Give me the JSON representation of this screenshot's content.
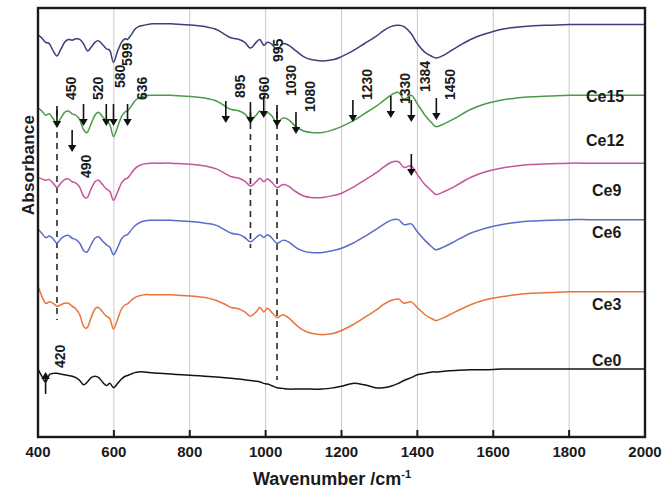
{
  "chart_data": {
    "type": "line",
    "title": "",
    "xlabel": "Wavenumber /cm",
    "xlabel_sup": "-1",
    "ylabel": "Absorbance",
    "xlim": [
      400,
      2000
    ],
    "xticks": [
      400,
      600,
      800,
      1000,
      1200,
      1400,
      1600,
      1800,
      2000
    ],
    "xtick_labels": [
      "400",
      "600",
      "800",
      "1000",
      "1200",
      "1400",
      "1600",
      "1800",
      "2000"
    ],
    "ylim": [
      0,
      6
    ],
    "yticks": [],
    "ytick_labels": [],
    "grid": "vertical-only",
    "legend_position": "right-inline",
    "series": [
      {
        "name": "Ce15",
        "color": "#3b3f7a",
        "offset": 5.0,
        "x": [
          400,
          410,
          420,
          430,
          440,
          450,
          460,
          470,
          480,
          490,
          500,
          510,
          520,
          530,
          540,
          550,
          560,
          570,
          580,
          590,
          599,
          610,
          620,
          630,
          636,
          645,
          655,
          665,
          680,
          700,
          720,
          750,
          780,
          810,
          840,
          870,
          895,
          910,
          930,
          945,
          960,
          975,
          985,
          995,
          1005,
          1015,
          1030,
          1045,
          1060,
          1080,
          1100,
          1120,
          1150,
          1180,
          1200,
          1230,
          1260,
          1290,
          1310,
          1330,
          1350,
          1365,
          1384,
          1400,
          1420,
          1440,
          1450,
          1470,
          1500,
          1540,
          1580,
          1620,
          1660,
          1700,
          1750,
          1800,
          1850,
          1900,
          1950,
          2000
        ],
        "y": [
          0.62,
          0.58,
          0.52,
          0.5,
          0.4,
          0.33,
          0.42,
          0.52,
          0.56,
          0.55,
          0.57,
          0.56,
          0.5,
          0.4,
          0.45,
          0.52,
          0.54,
          0.49,
          0.43,
          0.4,
          0.24,
          0.4,
          0.52,
          0.57,
          0.56,
          0.62,
          0.7,
          0.74,
          0.76,
          0.78,
          0.78,
          0.78,
          0.77,
          0.76,
          0.74,
          0.7,
          0.62,
          0.58,
          0.56,
          0.52,
          0.44,
          0.52,
          0.56,
          0.48,
          0.52,
          0.5,
          0.42,
          0.5,
          0.48,
          0.4,
          0.32,
          0.28,
          0.26,
          0.28,
          0.32,
          0.4,
          0.5,
          0.6,
          0.68,
          0.74,
          0.76,
          0.74,
          0.64,
          0.5,
          0.38,
          0.32,
          0.3,
          0.34,
          0.44,
          0.56,
          0.64,
          0.7,
          0.73,
          0.75,
          0.76,
          0.77,
          0.77,
          0.77,
          0.77,
          0.77
        ]
      },
      {
        "name": "Ce12",
        "color": "#4a9a4a",
        "offset": 4.0,
        "x": [
          400,
          410,
          420,
          430,
          440,
          450,
          460,
          470,
          480,
          490,
          500,
          510,
          520,
          530,
          540,
          550,
          560,
          570,
          580,
          590,
          599,
          610,
          620,
          630,
          636,
          645,
          655,
          665,
          680,
          700,
          720,
          750,
          780,
          810,
          840,
          870,
          895,
          910,
          930,
          945,
          960,
          975,
          985,
          995,
          1005,
          1015,
          1030,
          1045,
          1060,
          1080,
          1100,
          1120,
          1150,
          1180,
          1200,
          1230,
          1260,
          1290,
          1310,
          1330,
          1350,
          1365,
          1384,
          1400,
          1420,
          1440,
          1450,
          1470,
          1500,
          1540,
          1580,
          1620,
          1660,
          1700,
          1750,
          1800,
          1850,
          1900,
          1950,
          2000
        ],
        "y": [
          0.6,
          0.56,
          0.5,
          0.52,
          0.45,
          0.38,
          0.46,
          0.54,
          0.56,
          0.52,
          0.5,
          0.44,
          0.3,
          0.26,
          0.38,
          0.5,
          0.54,
          0.48,
          0.42,
          0.36,
          0.2,
          0.34,
          0.48,
          0.55,
          0.56,
          0.62,
          0.7,
          0.74,
          0.77,
          0.78,
          0.78,
          0.78,
          0.77,
          0.76,
          0.74,
          0.7,
          0.62,
          0.58,
          0.56,
          0.52,
          0.44,
          0.5,
          0.56,
          0.5,
          0.54,
          0.5,
          0.4,
          0.46,
          0.44,
          0.34,
          0.28,
          0.26,
          0.26,
          0.3,
          0.34,
          0.42,
          0.52,
          0.62,
          0.7,
          0.78,
          0.82,
          0.72,
          0.78,
          0.66,
          0.5,
          0.38,
          0.34,
          0.38,
          0.46,
          0.58,
          0.66,
          0.71,
          0.74,
          0.76,
          0.77,
          0.78,
          0.78,
          0.78,
          0.78,
          0.78
        ]
      },
      {
        "name": "Ce9",
        "color": "#c4559c",
        "offset": 3.05,
        "x": [
          400,
          410,
          420,
          430,
          440,
          450,
          460,
          470,
          480,
          490,
          500,
          510,
          520,
          530,
          540,
          550,
          560,
          570,
          580,
          590,
          599,
          610,
          620,
          630,
          636,
          645,
          655,
          665,
          680,
          700,
          720,
          750,
          780,
          810,
          840,
          870,
          895,
          910,
          930,
          945,
          960,
          975,
          985,
          995,
          1005,
          1015,
          1030,
          1045,
          1060,
          1080,
          1100,
          1120,
          1150,
          1180,
          1200,
          1230,
          1260,
          1290,
          1310,
          1330,
          1350,
          1365,
          1384,
          1400,
          1420,
          1440,
          1450,
          1470,
          1500,
          1540,
          1580,
          1620,
          1660,
          1700,
          1750,
          1800,
          1850,
          1900,
          1950,
          2000
        ],
        "y": [
          0.58,
          0.56,
          0.54,
          0.55,
          0.5,
          0.44,
          0.5,
          0.55,
          0.56,
          0.52,
          0.5,
          0.44,
          0.32,
          0.3,
          0.42,
          0.52,
          0.54,
          0.48,
          0.42,
          0.38,
          0.26,
          0.38,
          0.5,
          0.56,
          0.57,
          0.63,
          0.7,
          0.74,
          0.77,
          0.78,
          0.78,
          0.78,
          0.77,
          0.76,
          0.74,
          0.7,
          0.63,
          0.59,
          0.57,
          0.53,
          0.46,
          0.52,
          0.57,
          0.52,
          0.56,
          0.52,
          0.44,
          0.48,
          0.46,
          0.38,
          0.32,
          0.3,
          0.3,
          0.33,
          0.36,
          0.44,
          0.54,
          0.64,
          0.72,
          0.79,
          0.8,
          0.72,
          0.74,
          0.62,
          0.48,
          0.38,
          0.34,
          0.38,
          0.46,
          0.58,
          0.66,
          0.71,
          0.74,
          0.76,
          0.77,
          0.78,
          0.78,
          0.78,
          0.78,
          0.78
        ]
      },
      {
        "name": "Ce6",
        "color": "#5b6bc8",
        "offset": 2.25,
        "x": [
          400,
          410,
          420,
          430,
          440,
          450,
          460,
          470,
          480,
          490,
          500,
          510,
          520,
          530,
          540,
          550,
          560,
          570,
          580,
          590,
          599,
          610,
          620,
          630,
          636,
          645,
          655,
          665,
          680,
          700,
          720,
          750,
          780,
          810,
          840,
          870,
          895,
          910,
          930,
          945,
          960,
          975,
          985,
          995,
          1005,
          1015,
          1030,
          1045,
          1060,
          1080,
          1100,
          1120,
          1150,
          1180,
          1200,
          1230,
          1260,
          1290,
          1310,
          1330,
          1350,
          1365,
          1384,
          1400,
          1420,
          1440,
          1450,
          1470,
          1500,
          1540,
          1580,
          1620,
          1660,
          1700,
          1750,
          1800,
          1850,
          1900,
          1950,
          2000
        ],
        "y": [
          0.66,
          0.6,
          0.54,
          0.56,
          0.52,
          0.46,
          0.52,
          0.56,
          0.57,
          0.53,
          0.51,
          0.46,
          0.36,
          0.34,
          0.44,
          0.53,
          0.55,
          0.49,
          0.44,
          0.4,
          0.3,
          0.4,
          0.52,
          0.57,
          0.58,
          0.64,
          0.7,
          0.74,
          0.77,
          0.78,
          0.78,
          0.78,
          0.77,
          0.76,
          0.74,
          0.71,
          0.64,
          0.6,
          0.58,
          0.54,
          0.48,
          0.54,
          0.58,
          0.54,
          0.58,
          0.54,
          0.46,
          0.5,
          0.48,
          0.4,
          0.35,
          0.33,
          0.33,
          0.36,
          0.39,
          0.46,
          0.55,
          0.65,
          0.72,
          0.78,
          0.79,
          0.72,
          0.73,
          0.62,
          0.5,
          0.4,
          0.37,
          0.41,
          0.49,
          0.6,
          0.67,
          0.72,
          0.75,
          0.77,
          0.78,
          0.79,
          0.79,
          0.79,
          0.79,
          0.79
        ]
      },
      {
        "name": "Ce3",
        "color": "#e8743c",
        "offset": 1.25,
        "x": [
          400,
          410,
          420,
          430,
          440,
          450,
          460,
          470,
          480,
          490,
          500,
          510,
          520,
          530,
          540,
          550,
          560,
          570,
          580,
          590,
          599,
          610,
          620,
          630,
          636,
          645,
          655,
          665,
          680,
          700,
          720,
          750,
          780,
          810,
          840,
          870,
          895,
          910,
          930,
          945,
          960,
          975,
          985,
          995,
          1005,
          1015,
          1030,
          1045,
          1060,
          1080,
          1100,
          1120,
          1150,
          1180,
          1200,
          1230,
          1260,
          1290,
          1310,
          1330,
          1350,
          1365,
          1384,
          1400,
          1420,
          1440,
          1450,
          1470,
          1500,
          1540,
          1580,
          1620,
          1660,
          1700,
          1750,
          1800,
          1850,
          1900,
          1950,
          2000
        ],
        "y": [
          0.86,
          0.72,
          0.62,
          0.64,
          0.62,
          0.58,
          0.6,
          0.62,
          0.62,
          0.58,
          0.54,
          0.46,
          0.3,
          0.28,
          0.42,
          0.54,
          0.56,
          0.5,
          0.44,
          0.4,
          0.26,
          0.4,
          0.54,
          0.6,
          0.61,
          0.66,
          0.7,
          0.72,
          0.74,
          0.74,
          0.74,
          0.74,
          0.73,
          0.72,
          0.7,
          0.66,
          0.6,
          0.56,
          0.54,
          0.5,
          0.44,
          0.5,
          0.56,
          0.5,
          0.55,
          0.5,
          0.42,
          0.46,
          0.42,
          0.32,
          0.24,
          0.2,
          0.18,
          0.2,
          0.24,
          0.32,
          0.42,
          0.52,
          0.6,
          0.66,
          0.68,
          0.62,
          0.64,
          0.56,
          0.46,
          0.4,
          0.38,
          0.42,
          0.5,
          0.6,
          0.67,
          0.71,
          0.74,
          0.76,
          0.77,
          0.78,
          0.78,
          0.78,
          0.78,
          0.78
        ]
      },
      {
        "name": "Ce0",
        "color": "#141414",
        "offset": 0.25,
        "x": [
          400,
          410,
          420,
          430,
          440,
          450,
          460,
          470,
          480,
          490,
          500,
          510,
          520,
          530,
          540,
          550,
          560,
          570,
          580,
          590,
          599,
          610,
          620,
          630,
          636,
          645,
          655,
          665,
          680,
          700,
          720,
          750,
          780,
          810,
          840,
          870,
          895,
          910,
          930,
          945,
          960,
          975,
          985,
          995,
          1005,
          1015,
          1030,
          1045,
          1060,
          1080,
          1100,
          1120,
          1150,
          1180,
          1200,
          1230,
          1260,
          1290,
          1310,
          1330,
          1350,
          1365,
          1384,
          1400,
          1420,
          1440,
          1450,
          1470,
          1500,
          1540,
          1580,
          1620,
          1660,
          1700,
          1750,
          1800,
          1850,
          1900,
          1950,
          2000
        ],
        "y": [
          0.7,
          0.6,
          0.52,
          0.62,
          0.64,
          0.64,
          0.63,
          0.62,
          0.61,
          0.6,
          0.58,
          0.54,
          0.48,
          0.52,
          0.58,
          0.6,
          0.58,
          0.52,
          0.47,
          0.5,
          0.44,
          0.5,
          0.56,
          0.6,
          0.61,
          0.63,
          0.65,
          0.66,
          0.66,
          0.65,
          0.64,
          0.63,
          0.62,
          0.61,
          0.6,
          0.59,
          0.58,
          0.57,
          0.56,
          0.55,
          0.54,
          0.53,
          0.52,
          0.5,
          0.49,
          0.47,
          0.44,
          0.43,
          0.42,
          0.42,
          0.42,
          0.42,
          0.42,
          0.44,
          0.46,
          0.5,
          0.48,
          0.44,
          0.44,
          0.46,
          0.5,
          0.54,
          0.58,
          0.62,
          0.64,
          0.66,
          0.66,
          0.67,
          0.68,
          0.69,
          0.69,
          0.7,
          0.7,
          0.7,
          0.7,
          0.7,
          0.7,
          0.7,
          0.7,
          0.7
        ]
      }
    ],
    "peak_annotations": [
      {
        "label": "450",
        "x": 450
      },
      {
        "label": "490",
        "x": 490
      },
      {
        "label": "520",
        "x": 520
      },
      {
        "label": "580",
        "x": 580
      },
      {
        "label": "599",
        "x": 599
      },
      {
        "label": "636",
        "x": 636
      },
      {
        "label": "895",
        "x": 895
      },
      {
        "label": "960",
        "x": 960
      },
      {
        "label": "995",
        "x": 995
      },
      {
        "label": "1030",
        "x": 1030
      },
      {
        "label": "1080",
        "x": 1080
      },
      {
        "label": "1230",
        "x": 1230
      },
      {
        "label": "1330",
        "x": 1330
      },
      {
        "label": "1384",
        "x": 1384
      },
      {
        "label": "1450",
        "x": 1450
      },
      {
        "label": "420",
        "x": 420
      }
    ],
    "guide_lines": [
      {
        "x": 450
      },
      {
        "x": 960
      },
      {
        "x": 1030
      }
    ]
  },
  "annotations": {
    "a450": "450",
    "a490": "490",
    "a520": "520",
    "a580": "580",
    "a599": "599",
    "a636": "636",
    "a895": "895",
    "a960": "960",
    "a995": "995",
    "a1030": "1030",
    "a1080": "1080",
    "a1230": "1230",
    "a1330": "1330",
    "a1384": "1384",
    "a1450": "1450",
    "a420": "420"
  },
  "series_labels": {
    "ce15": "Ce15",
    "ce12": "Ce12",
    "ce9": "Ce9",
    "ce6": "Ce6",
    "ce3": "Ce3",
    "ce0": "Ce0"
  },
  "axes": {
    "ylabel": "Absorbance",
    "xlabel": "Wavenumber /cm",
    "xlabel_sup": "-1",
    "t400": "400",
    "t600": "600",
    "t800": "800",
    "t1000": "1000",
    "t1200": "1200",
    "t1400": "1400",
    "t1600": "1600",
    "t1800": "1800",
    "t2000": "2000"
  }
}
